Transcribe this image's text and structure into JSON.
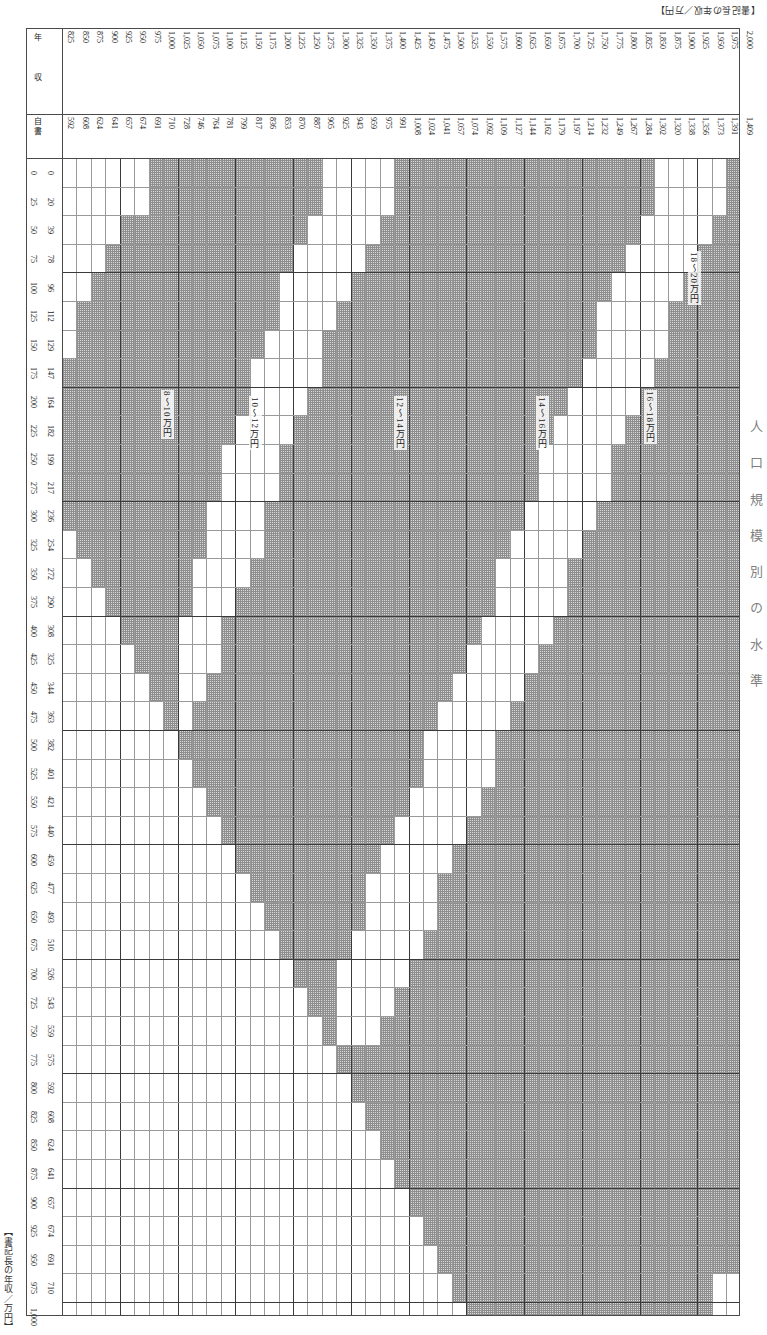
{
  "captions": {
    "top_right": "【書記長の年収／万円】",
    "bottom_left": "【書記長の年収／万円】",
    "side_title": "人 口 規 模 別 の 水 準"
  },
  "header": {
    "corner_label_1": "年",
    "corner_label_2": "収",
    "sub_corner_label": "自 書",
    "axis_corner_label_1": "給",
    "axis_corner_label_2": "与"
  },
  "chart_data": {
    "type": "heatmap",
    "xlabel": "書記長の年収（万円）",
    "ylabel": "自書給与（万円）",
    "grid": true,
    "legend_position": "in-plot-diagonal-bands",
    "annotations": [
      {
        "label": "18～20万円",
        "x_pct": 92.5,
        "y_pct": 8.0
      },
      {
        "label": "16～18万円",
        "x_pct": 86.0,
        "y_pct": 20.0
      },
      {
        "label": "14～16万円",
        "x_pct": 70.0,
        "y_pct": 20.5
      },
      {
        "label": "12～14万円",
        "x_pct": 49.0,
        "y_pct": 20.5
      },
      {
        "label": "10～12万円",
        "x_pct": 27.5,
        "y_pct": 20.5
      },
      {
        "label": "8～10万円",
        "x_pct": 14.5,
        "y_pct": 20.0
      }
    ],
    "x_axis_primary": [
      "825",
      "850",
      "875",
      "900",
      "925",
      "950",
      "975",
      "1,000",
      "1,025",
      "1,050",
      "1,075",
      "1,100",
      "1,125",
      "1,150",
      "1,175",
      "1,200",
      "1,225",
      "1,250",
      "1,275",
      "1,300",
      "1,325",
      "1,350",
      "1,375",
      "1,400",
      "1,425",
      "1,450",
      "1,475",
      "1,500",
      "1,525",
      "1,550",
      "1,575",
      "1,600",
      "1,625",
      "1,650",
      "1,675",
      "1,700",
      "1,725",
      "1,750",
      "1,775",
      "1,800",
      "1,825",
      "1,850",
      "1,875",
      "1,900",
      "1,925",
      "1,950",
      "1,975",
      "2,000"
    ],
    "x_axis_secondary": [
      "592",
      "608",
      "624",
      "641",
      "657",
      "674",
      "691",
      "710",
      "728",
      "746",
      "764",
      "781",
      "799",
      "817",
      "836",
      "853",
      "870",
      "887",
      "905",
      "925",
      "943",
      "959",
      "975",
      "991",
      "1,008",
      "1,024",
      "1,041",
      "1,057",
      "1,074",
      "1,092",
      "1,109",
      "1,127",
      "1,144",
      "1,162",
      "1,179",
      "1,197",
      "1,214",
      "1,232",
      "1,249",
      "1,267",
      "1,284",
      "1,302",
      "1,320",
      "1,338",
      "1,356",
      "1,373",
      "1,391",
      "1,409"
    ],
    "y_axis_primary": [
      "0",
      "25",
      "50",
      "75",
      "100",
      "125",
      "150",
      "175",
      "200",
      "225",
      "250",
      "275",
      "300",
      "325",
      "350",
      "375",
      "400",
      "425",
      "450",
      "475",
      "500",
      "525",
      "550",
      "575",
      "600",
      "625",
      "650",
      "675",
      "700",
      "725",
      "750",
      "775",
      "800",
      "825",
      "850",
      "875",
      "900",
      "925",
      "950",
      "975",
      "1,000"
    ],
    "y_axis_secondary": [
      "0",
      "20",
      "39",
      "78",
      "96",
      "112",
      "129",
      "147",
      "164",
      "182",
      "199",
      "217",
      "236",
      "254",
      "272",
      "290",
      "308",
      "325",
      "344",
      "363",
      "382",
      "401",
      "421",
      "440",
      "459",
      "477",
      "493",
      "510",
      "526",
      "543",
      "559",
      "575",
      "592",
      "608",
      "624",
      "641",
      "657",
      "674",
      "691",
      "710",
      ""
    ],
    "bands": [
      {
        "name": "8～10万円",
        "low": 8,
        "high": 10
      },
      {
        "name": "10～12万円",
        "low": 10,
        "high": 12
      },
      {
        "name": "12～14万円",
        "low": 12,
        "high": 14
      },
      {
        "name": "14～16万円",
        "low": 14,
        "high": 16
      },
      {
        "name": "16～18万円",
        "low": 16,
        "high": 18
      },
      {
        "name": "18～20万円",
        "low": 18,
        "high": 20
      }
    ],
    "note": "Shaded cells mark the qualifying combinations of 年収 (columns) and 給与 (rows) for each 万円 band; bands run as diagonal stripes down-right.",
    "shaded_runs": [
      {
        "row": 0,
        "spans": [
          [
            6,
            17
          ],
          [
            23,
            40
          ],
          [
            46,
            47
          ]
        ]
      },
      {
        "row": 1,
        "spans": [
          [
            6,
            17
          ],
          [
            23,
            40
          ],
          [
            46,
            47
          ]
        ]
      },
      {
        "row": 2,
        "spans": [
          [
            4,
            16
          ],
          [
            22,
            39
          ],
          [
            45,
            47
          ]
        ]
      },
      {
        "row": 3,
        "spans": [
          [
            3,
            15
          ],
          [
            21,
            38
          ],
          [
            44,
            47
          ]
        ]
      },
      {
        "row": 4,
        "spans": [
          [
            2,
            14
          ],
          [
            20,
            37
          ],
          [
            43,
            47
          ]
        ]
      },
      {
        "row": 5,
        "spans": [
          [
            1,
            14
          ],
          [
            19,
            36
          ],
          [
            42,
            47
          ]
        ]
      },
      {
        "row": 6,
        "spans": [
          [
            1,
            13
          ],
          [
            18,
            36
          ],
          [
            42,
            47
          ]
        ]
      },
      {
        "row": 7,
        "spans": [
          [
            0,
            12
          ],
          [
            18,
            35
          ],
          [
            41,
            47
          ]
        ]
      },
      {
        "row": 8,
        "spans": [
          [
            0,
            12
          ],
          [
            17,
            34
          ],
          [
            40,
            47
          ]
        ]
      },
      {
        "row": 9,
        "spans": [
          [
            0,
            11
          ],
          [
            16,
            33
          ],
          [
            39,
            47
          ]
        ]
      },
      {
        "row": 10,
        "spans": [
          [
            0,
            10
          ],
          [
            15,
            32
          ],
          [
            38,
            47
          ]
        ]
      },
      {
        "row": 11,
        "spans": [
          [
            0,
            10
          ],
          [
            15,
            32
          ],
          [
            38,
            47
          ]
        ]
      },
      {
        "row": 12,
        "spans": [
          [
            0,
            9
          ],
          [
            14,
            31
          ],
          [
            37,
            47
          ]
        ]
      },
      {
        "row": 13,
        "spans": [
          [
            1,
            9
          ],
          [
            14,
            30
          ],
          [
            36,
            47
          ]
        ]
      },
      {
        "row": 14,
        "spans": [
          [
            2,
            8
          ],
          [
            13,
            29
          ],
          [
            35,
            47
          ]
        ]
      },
      {
        "row": 15,
        "spans": [
          [
            3,
            8
          ],
          [
            12,
            29
          ],
          [
            35,
            47
          ]
        ]
      },
      {
        "row": 16,
        "spans": [
          [
            4,
            7
          ],
          [
            11,
            28
          ],
          [
            34,
            47
          ]
        ]
      },
      {
        "row": 17,
        "spans": [
          [
            5,
            7
          ],
          [
            11,
            27
          ],
          [
            33,
            47
          ]
        ]
      },
      {
        "row": 18,
        "spans": [
          [
            6,
            7
          ],
          [
            10,
            26
          ],
          [
            32,
            47
          ]
        ]
      },
      {
        "row": 19,
        "spans": [
          [
            7,
            7
          ],
          [
            9,
            25
          ],
          [
            31,
            47
          ]
        ]
      },
      {
        "row": 20,
        "spans": [
          [
            8,
            24
          ],
          [
            30,
            47
          ]
        ]
      },
      {
        "row": 21,
        "spans": [
          [
            9,
            24
          ],
          [
            30,
            47
          ]
        ]
      },
      {
        "row": 22,
        "spans": [
          [
            10,
            23
          ],
          [
            29,
            47
          ]
        ]
      },
      {
        "row": 23,
        "spans": [
          [
            11,
            22
          ],
          [
            28,
            47
          ]
        ]
      },
      {
        "row": 24,
        "spans": [
          [
            12,
            21
          ],
          [
            27,
            47
          ]
        ]
      },
      {
        "row": 25,
        "spans": [
          [
            13,
            20
          ],
          [
            26,
            47
          ]
        ]
      },
      {
        "row": 26,
        "spans": [
          [
            14,
            20
          ],
          [
            26,
            47
          ]
        ]
      },
      {
        "row": 27,
        "spans": [
          [
            15,
            19
          ],
          [
            25,
            47
          ]
        ]
      },
      {
        "row": 28,
        "spans": [
          [
            16,
            18
          ],
          [
            24,
            47
          ]
        ]
      },
      {
        "row": 29,
        "spans": [
          [
            17,
            18
          ],
          [
            23,
            47
          ]
        ]
      },
      {
        "row": 30,
        "spans": [
          [
            18,
            18
          ],
          [
            22,
            47
          ]
        ]
      },
      {
        "row": 31,
        "spans": [
          [
            19,
            47
          ]
        ]
      },
      {
        "row": 32,
        "spans": [
          [
            20,
            47
          ]
        ]
      },
      {
        "row": 33,
        "spans": [
          [
            21,
            47
          ]
        ]
      },
      {
        "row": 34,
        "spans": [
          [
            22,
            47
          ]
        ]
      },
      {
        "row": 35,
        "spans": [
          [
            23,
            47
          ]
        ]
      },
      {
        "row": 36,
        "spans": [
          [
            24,
            47
          ]
        ]
      },
      {
        "row": 37,
        "spans": [
          [
            25,
            47
          ]
        ]
      },
      {
        "row": 38,
        "spans": [
          [
            26,
            47
          ]
        ]
      },
      {
        "row": 39,
        "spans": [
          [
            27,
            44
          ]
        ]
      },
      {
        "row": 40,
        "spans": [
          [
            28,
            44
          ]
        ]
      }
    ]
  }
}
